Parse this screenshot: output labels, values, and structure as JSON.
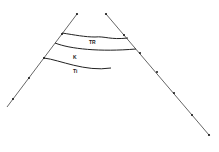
{
  "diagram": {
    "type": "fault-block cross-section",
    "labels": {
      "upper_layer": "TR",
      "middle_layer": "K",
      "lower_layer": "Ti"
    },
    "colors": {
      "line": "#333333",
      "fault": "#555555",
      "marker": "#111111"
    }
  }
}
